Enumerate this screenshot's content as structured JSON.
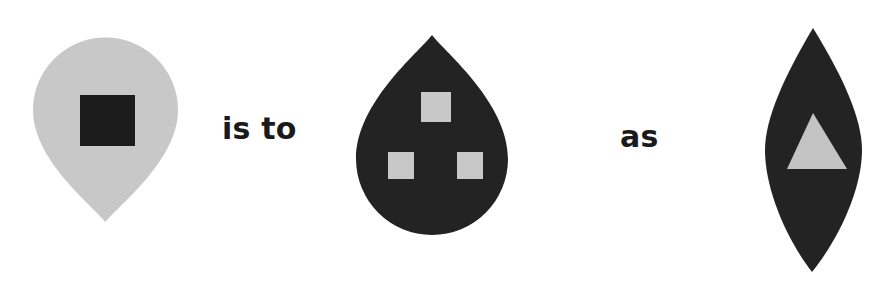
{
  "puzzle": {
    "type": "visual-analogy",
    "format": "A is to B as C",
    "connectors": {
      "first": "is to",
      "second": "as"
    },
    "panels": [
      {
        "id": "panel-a",
        "position": "left",
        "outer_shape": "teardrop-pointing-down",
        "outer_color": "#c8c8c8",
        "inner_shape": "square",
        "inner_color": "#1c1c1c",
        "inner_count": 1,
        "inner_arrangement": "center"
      },
      {
        "id": "panel-b",
        "position": "middle",
        "outer_shape": "teardrop-pointing-up",
        "outer_color": "#232323",
        "inner_shape": "square",
        "inner_color": "#c8c8c8",
        "inner_count": 3,
        "inner_arrangement": "triangular-one-top-two-bottom"
      },
      {
        "id": "panel-c",
        "position": "right",
        "outer_shape": "lens-vesica-vertical",
        "outer_color": "#232323",
        "inner_shape": "triangle",
        "inner_color": "#c3c3c3",
        "inner_count": 1,
        "inner_arrangement": "center"
      }
    ]
  },
  "colors": {
    "background": "#ffffff",
    "light_gray": "#c8c8c8",
    "dark": "#232323",
    "darkest": "#1c1c1c",
    "text": "#1a1a1a"
  }
}
